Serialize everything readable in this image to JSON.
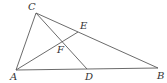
{
  "diagram": {
    "type": "geometry",
    "points": {
      "A": {
        "label": "A",
        "x": 16,
        "y": 70,
        "lx": 10,
        "ly": 80
      },
      "B": {
        "label": "B",
        "x": 158,
        "y": 68,
        "lx": 157,
        "ly": 79
      },
      "C": {
        "label": "C",
        "x": 36,
        "y": 13,
        "lx": 28,
        "ly": 10
      },
      "D": {
        "label": "D",
        "x": 87,
        "y": 69,
        "lx": 85,
        "ly": 80
      },
      "E": {
        "label": "E",
        "x": 78,
        "y": 32,
        "lx": 80,
        "ly": 29
      },
      "F": {
        "label": "F",
        "x": 62,
        "y": 41,
        "lx": 57,
        "ly": 53
      }
    },
    "segments": [
      [
        "A",
        "C"
      ],
      [
        "C",
        "B"
      ],
      [
        "A",
        "B"
      ],
      [
        "C",
        "D"
      ],
      [
        "A",
        "E"
      ]
    ],
    "colors": {
      "line": "#5a5a5a",
      "label": "#333333"
    }
  }
}
